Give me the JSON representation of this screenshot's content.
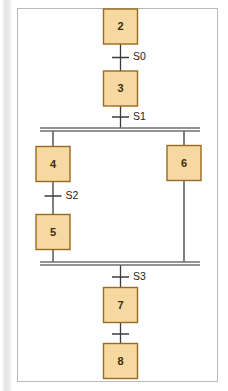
{
  "figure": {
    "kind": "sequential-function-chart",
    "background_color": "#ffffff",
    "frame_border_color": "#b9b9b9",
    "step_fill_color": "#f5d9a0",
    "step_border_color": "#9a6a22",
    "line_color": "#3b3b3b",
    "parallel_bar_color": "#6f6f6f"
  },
  "chart_data": {
    "type": "diagram",
    "title": "",
    "steps": [
      {
        "id": "step-2",
        "label": "2",
        "x": 120.5,
        "y": 26.5,
        "w": 34,
        "h": 35
      },
      {
        "id": "step-3",
        "label": "3",
        "x": 120.5,
        "y": 88.5,
        "w": 34,
        "h": 35
      },
      {
        "id": "step-4",
        "label": "4",
        "x": 53.0,
        "y": 164.0,
        "w": 34,
        "h": 35
      },
      {
        "id": "step-6",
        "label": "6",
        "x": 184.0,
        "y": 163.0,
        "w": 34,
        "h": 35
      },
      {
        "id": "step-5",
        "label": "5",
        "x": 53.0,
        "y": 232.0,
        "w": 34,
        "h": 35
      },
      {
        "id": "step-7",
        "label": "7",
        "x": 120.5,
        "y": 305.0,
        "w": 34,
        "h": 35
      },
      {
        "id": "step-8",
        "label": "8",
        "x": 120.5,
        "y": 361.0,
        "w": 34,
        "h": 35
      }
    ],
    "transitions": [
      {
        "id": "transition-s0",
        "label": "S0",
        "x": 120.5,
        "y": 57.5,
        "label_x": 133,
        "label_y": 57.5
      },
      {
        "id": "transition-s1",
        "label": "S1",
        "x": 120.5,
        "y": 117.0,
        "label_x": 133,
        "label_y": 117.0
      },
      {
        "id": "transition-s2",
        "label": "S2",
        "x": 53.0,
        "y": 196.0,
        "label_x": 65.5,
        "label_y": 196.0
      },
      {
        "id": "transition-s3",
        "label": "S3",
        "x": 120.5,
        "y": 277.0,
        "label_x": 133,
        "label_y": 277.0
      },
      {
        "id": "transition-unlabeled",
        "label": "",
        "x": 120.5,
        "y": 334.0,
        "label_x": 133,
        "label_y": 334.0
      }
    ],
    "parallel_bars": [
      {
        "id": "parallel-split-bar",
        "x1": 40,
        "x2": 200,
        "y_top": 128.0,
        "y_bottom": 131.0
      },
      {
        "id": "parallel-join-bar",
        "x1": 40,
        "x2": 200,
        "y_top": 262.0,
        "y_bottom": 265.0
      }
    ]
  }
}
